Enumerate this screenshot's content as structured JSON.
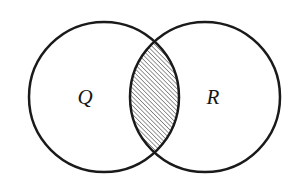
{
  "figure": {
    "kind": "venn-diagram",
    "caption": "",
    "background_color": "#ffffff",
    "stroke_color": "#1a1a1a",
    "stroke_width": 2.5,
    "width": 299,
    "height": 194
  },
  "sets": [
    {
      "id": "Q",
      "label": "Q",
      "center_x": 104,
      "center_y": 97,
      "radius": 75,
      "fill": "none"
    },
    {
      "id": "R",
      "label": "R",
      "center_x": 205,
      "center_y": 97,
      "radius": 75,
      "fill": "none"
    }
  ],
  "labels": {
    "left_label": "Q",
    "left_label_x": 85,
    "left_label_y": 104,
    "right_label": "R",
    "right_label_x": 213,
    "right_label_y": 104
  },
  "intersection": {
    "shaded": true,
    "fill_pattern": "diagonal-hatch",
    "hatch_angle_deg": 45,
    "hatch_spacing": 3,
    "hatch_color": "#1a1a1a",
    "hatch_stroke_width": 0.9,
    "top_crossing_x": 155,
    "top_crossing_y": 52,
    "bottom_crossing_x": 155,
    "bottom_crossing_y": 143,
    "widest_left_x": 140,
    "widest_right_x": 170
  }
}
